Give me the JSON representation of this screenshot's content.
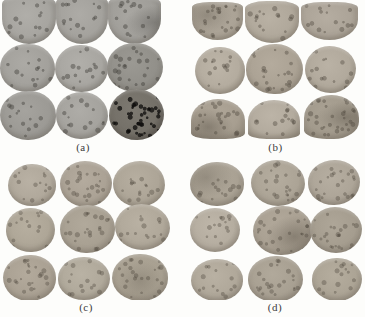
{
  "figure": {
    "background": "#fdfdfb",
    "label_color": "#3b3b3b"
  },
  "panels": [
    {
      "id": "a",
      "label": "(a)",
      "edge": "#84827c",
      "dot": "rgba(55,53,48,0.40)",
      "discs": [
        {
          "x": 2,
          "y": -4,
          "w": 54,
          "h": 48,
          "base": "#a7a5a0",
          "br": "40% 40% 50% 50% / 16% 16% 52% 52%"
        },
        {
          "x": 56,
          "y": -5,
          "w": 52,
          "h": 49,
          "base": "#a4a29d",
          "br": "40% 40% 50% 50% / 16% 16% 52% 52%"
        },
        {
          "x": 108,
          "y": -4,
          "w": 53,
          "h": 48,
          "base": "#a09e99",
          "br": "40% 40% 50% 50% / 16% 16% 52% 52%",
          "blotch": {
            "x": 88,
            "y": 55,
            "c": "rgba(80,78,74,0.40)",
            "s": 45
          }
        },
        {
          "x": 0,
          "y": 44,
          "w": 55,
          "h": 48,
          "base": "#a3a19c",
          "br": "50% 48% 52% 50% / 50% 52% 48% 50%"
        },
        {
          "x": 55,
          "y": 45,
          "w": 53,
          "h": 47,
          "base": "#a8a6a1",
          "br": "48% 52% 50% 50% / 52% 48% 50% 50%"
        },
        {
          "x": 107,
          "y": 43,
          "w": 56,
          "h": 49,
          "base": "#92908a",
          "br": "50% 50% 48% 52% / 50% 50% 52% 48%",
          "speckle": 2
        },
        {
          "x": 0,
          "y": 91,
          "w": 56,
          "h": 49,
          "base": "#9c9a95",
          "br": "52% 48% 50% 50% / 50% 50% 48% 52%"
        },
        {
          "x": 56,
          "y": 92,
          "w": 52,
          "h": 47,
          "base": "#a5a39e",
          "br": "50% 50% 52% 48% / 48% 52% 50% 50%"
        },
        {
          "x": 109,
          "y": 89,
          "w": 55,
          "h": 51,
          "base": "#747068",
          "edge": "#4a4742",
          "dot": "rgba(12,11,10,0.75)",
          "speckle": 4,
          "br": "50% 50% 48% 50% / 52% 50% 50% 48%"
        }
      ]
    },
    {
      "id": "b",
      "label": "(b)",
      "edge": "#8e8678",
      "dot": "rgba(72,65,55,0.38)",
      "discs": [
        {
          "x": 6,
          "y": 2,
          "w": 51,
          "h": 38,
          "base": "#aaa295",
          "br": "34% 34% 50% 50% / 14% 14% 54% 54%",
          "speckle": 2,
          "blotch": {
            "x": 30,
            "y": 35,
            "c": "rgba(78,71,60,0.30)",
            "s": 50
          }
        },
        {
          "x": 59,
          "y": 1,
          "w": 54,
          "h": 42,
          "base": "#b0a89b",
          "br": "40% 40% 50% 50% / 18% 18% 52% 52%"
        },
        {
          "x": 115,
          "y": 2,
          "w": 57,
          "h": 38,
          "base": "#aca498",
          "br": "36% 36% 50% 50% / 15% 15% 54% 54%"
        },
        {
          "x": 9,
          "y": 47,
          "w": 50,
          "h": 47,
          "base": "#b4ac9f",
          "br": "50% 50% 50% 50% / 52% 50% 48% 50%"
        },
        {
          "x": 60,
          "y": 44,
          "w": 57,
          "h": 50,
          "base": "#aba294",
          "br": "52% 48% 50% 50% / 50% 52% 50% 48%",
          "speckle": 2
        },
        {
          "x": 119,
          "y": 46,
          "w": 51,
          "h": 47,
          "base": "#b1a99c",
          "br": "48% 52% 50% 50% / 50% 48% 52% 50%"
        },
        {
          "x": 5,
          "y": 99,
          "w": 54,
          "h": 40,
          "base": "#a79e90",
          "br": "50% 50% 36% 36% / 54% 54% 15% 15%",
          "speckle": 2,
          "blotch": {
            "x": 32,
            "y": 70,
            "c": "rgba(75,68,57,0.38)",
            "s": 48
          }
        },
        {
          "x": 62,
          "y": 100,
          "w": 52,
          "h": 39,
          "base": "#b3ab9e",
          "br": "50% 50% 36% 36% / 54% 54% 15% 15%"
        },
        {
          "x": 118,
          "y": 95,
          "w": 55,
          "h": 44,
          "base": "#a29a8c",
          "br": "50% 50% 46% 42% / 52% 52% 40% 20%",
          "speckle": 3,
          "blotch": {
            "x": 78,
            "y": 50,
            "c": "rgba(70,63,52,0.35)",
            "s": 50
          }
        }
      ]
    },
    {
      "id": "c",
      "label": "(c)",
      "edge": "#8e8679",
      "dot": "rgba(72,65,55,0.35)",
      "discs": [
        {
          "x": 8,
          "y": 6,
          "w": 48,
          "h": 42,
          "base": "#b0a89b",
          "br": "50% 50% 50% 50% / 52% 50% 48% 50%"
        },
        {
          "x": 60,
          "y": 3,
          "w": 52,
          "h": 46,
          "base": "#aba295",
          "br": "48% 52% 50% 50% / 50% 48% 52% 50%",
          "speckle": 2
        },
        {
          "x": 113,
          "y": 3,
          "w": 52,
          "h": 46,
          "base": "#ada597",
          "br": "52% 48% 50% 50% / 50% 52% 48% 50%"
        },
        {
          "x": 6,
          "y": 50,
          "w": 49,
          "h": 44,
          "base": "#aea697",
          "br": "50% 50% 48% 52% / 50% 50% 52% 48%"
        },
        {
          "x": 60,
          "y": 47,
          "w": 55,
          "h": 48,
          "base": "#a8a092",
          "br": "50% 50% 52% 48% / 52% 48% 50% 50%",
          "speckle": 2
        },
        {
          "x": 115,
          "y": 46,
          "w": 55,
          "h": 46,
          "base": "#b0a89a",
          "br": "48% 52% 50% 50% / 50% 52% 48% 50%"
        },
        {
          "x": 3,
          "y": 97,
          "w": 53,
          "h": 46,
          "base": "#aaa193",
          "br": "52% 48% 50% 50% / 50% 50% 48% 52%",
          "speckle": 2
        },
        {
          "x": 58,
          "y": 99,
          "w": 52,
          "h": 43,
          "base": "#b0a99b",
          "br": "50% 50% 50% 50% / 50% 52% 50% 48%"
        },
        {
          "x": 112,
          "y": 96,
          "w": 56,
          "h": 47,
          "base": "#a79f90",
          "br": "50% 50% 48% 52% / 52% 50% 48% 50%",
          "speckle": 2,
          "blotch": {
            "x": 50,
            "y": 55,
            "c": "rgba(75,68,57,0.25)",
            "s": 55
          }
        }
      ]
    },
    {
      "id": "d",
      "label": "(d)",
      "edge": "#8e8679",
      "dot": "rgba(72,65,55,0.35)",
      "discs": [
        {
          "x": 5,
          "y": 4,
          "w": 54,
          "h": 44,
          "base": "#a9a193",
          "br": "50% 50% 50% 50% / 52% 48% 50% 50%",
          "blotch": {
            "x": 30,
            "y": 35,
            "c": "rgba(78,71,60,0.28)",
            "s": 50
          }
        },
        {
          "x": 66,
          "y": 2,
          "w": 54,
          "h": 46,
          "base": "#aca496",
          "br": "48% 52% 50% 50% / 50% 52% 48% 50%",
          "speckle": 2
        },
        {
          "x": 123,
          "y": 2,
          "w": 52,
          "h": 45,
          "base": "#ada598",
          "br": "52% 48% 50% 50% / 50% 50% 52% 48%",
          "speckle": 2
        },
        {
          "x": 5,
          "y": 50,
          "w": 50,
          "h": 44,
          "base": "#b5ada0",
          "br": "50% 50% 50% 50% / 50% 50% 50% 50%"
        },
        {
          "x": 68,
          "y": 48,
          "w": 59,
          "h": 49,
          "base": "#a9a092",
          "br": "50% 50% 52% 48% / 52% 50% 48% 50%",
          "speckle": 2,
          "blotch": {
            "x": 70,
            "y": 62,
            "c": "rgba(70,63,52,0.35)",
            "s": 48
          }
        },
        {
          "x": 125,
          "y": 49,
          "w": 52,
          "h": 46,
          "base": "#a59d8f",
          "br": "48% 52% 50% 50% / 50% 48% 52% 50%",
          "speckle": 2
        },
        {
          "x": 6,
          "y": 101,
          "w": 52,
          "h": 42,
          "base": "#b0a89a",
          "br": "50% 50% 50% 50% / 52% 50% 48% 50%"
        },
        {
          "x": 63,
          "y": 98,
          "w": 55,
          "h": 46,
          "base": "#a8a092",
          "br": "52% 48% 50% 50% / 50% 52% 50% 48%",
          "speckle": 2
        },
        {
          "x": 127,
          "y": 100,
          "w": 50,
          "h": 43,
          "base": "#aca495",
          "br": "50% 50% 48% 52% / 50% 50% 52% 48%"
        }
      ]
    }
  ]
}
